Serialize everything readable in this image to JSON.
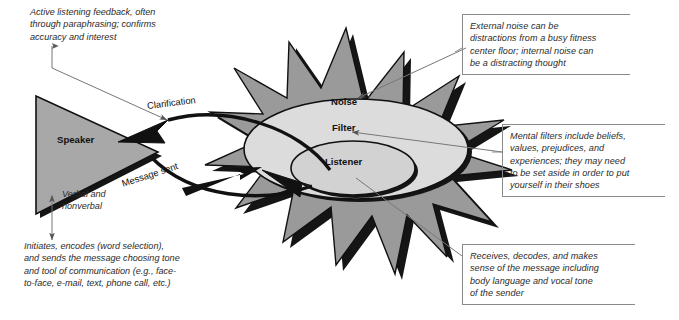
{
  "figure": {
    "canvas": {
      "width": 679,
      "height": 320,
      "background": "#ffffff"
    }
  },
  "palette": {
    "starburst_fill": "#9a9a9a",
    "starburst_shadow": "#1a1a1a",
    "filter_fill": "#dcdcdc",
    "listener_fill": "#d2d2d2",
    "speaker_fill": "#a8a8a8",
    "outline": "#111111",
    "connector": "#7d7d7d",
    "bracket_border": "#8a8a8a",
    "text": "#2b2b2b"
  },
  "shapes": {
    "speaker": {
      "label": "Speaker",
      "shape": "triangle",
      "fill": "#a8a8a8"
    },
    "noise": {
      "label": "Noise",
      "shape": "starburst",
      "points": 12,
      "fill": "#9a9a9a"
    },
    "filter": {
      "label": "Filter",
      "shape": "ellipse",
      "fill": "#dcdcdc"
    },
    "listener": {
      "label": "Listener",
      "shape": "ellipse",
      "fill": "#d2d2d2"
    }
  },
  "flows": {
    "clarification": {
      "label": "Clarification",
      "direction": "listener-to-speaker",
      "rotation_deg": -7
    },
    "message_sent": {
      "label": "Message sent",
      "direction": "speaker-to-listener",
      "rotation_deg": -18
    }
  },
  "notes": {
    "feedback": {
      "name": "active-listening-feedback-note",
      "text": "Active listening feedback, often\nthrough paraphrasing; confirms\naccuracy and interest",
      "boxed": false
    },
    "external_noise": {
      "name": "external-noise-note",
      "text": "External noise can be\ndistractions from a busy fitness\ncenter floor; internal noise can\nbe a distracting thought",
      "boxed": true
    },
    "mental_filters": {
      "name": "mental-filters-note",
      "text": "Mental filters include beliefs,\nvalues, prejudices, and\nexperiences; they may need\nto be set aside in order to put\nyourself in their shoes",
      "boxed": true
    },
    "receives": {
      "name": "receives-decodes-note",
      "text": "Receives, decodes, and makes\nsense of the message including\nbody language and vocal tone\nof the sender",
      "boxed": true
    },
    "verbal": {
      "name": "verbal-and-nonverbal-note",
      "text": "Verbal and\nnonverbal",
      "boxed": false
    },
    "initiates": {
      "name": "initiates-encodes-note",
      "text": "Initiates, encodes (word selection),\nand sends the message choosing tone\nand tool of communication (e.g., face-\nto-face, e-mail, text, phone call, etc.)",
      "boxed": false
    }
  }
}
